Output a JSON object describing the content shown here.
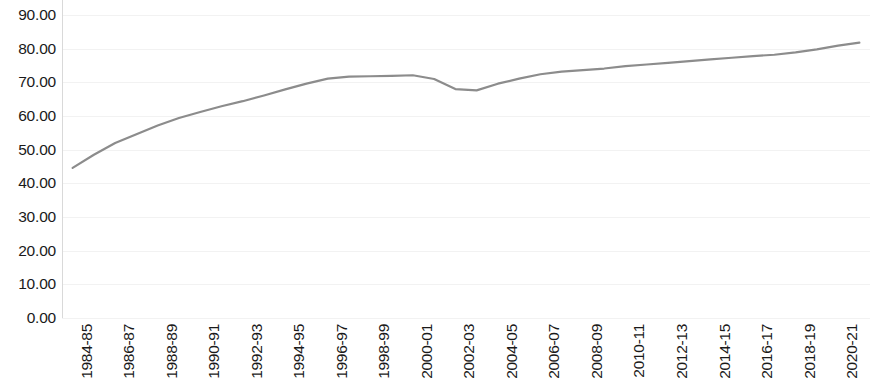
{
  "chart_data": {
    "type": "line",
    "title": "",
    "subtitle": "",
    "xlabel": "",
    "ylabel": "",
    "grid": true,
    "legend": false,
    "legend_position": "none",
    "line_color": "#8c8c8c",
    "line_width": 2.2,
    "ylim": [
      0,
      90
    ],
    "ytick_labels": [
      "90.00",
      "80.00",
      "70.00",
      "60.00",
      "50.00",
      "40.00",
      "30.00",
      "20.00",
      "10.00",
      "0.00"
    ],
    "ytick_values": [
      90,
      80,
      70,
      60,
      50,
      40,
      30,
      20,
      10,
      0
    ],
    "xtick_labels": [
      "1984-85",
      "1986-87",
      "1988-89",
      "1990-91",
      "1992-93",
      "1994-95",
      "1996-97",
      "1998-99",
      "2000-01",
      "2002-03",
      "2004-05",
      "2006-07",
      "2008-09",
      "2010-11",
      "2012-13",
      "2014-15",
      "2016-17",
      "2018-19",
      "2020-21"
    ],
    "categories": [
      "1984-85",
      "1985-86",
      "1986-87",
      "1987-88",
      "1988-89",
      "1989-90",
      "1990-91",
      "1991-92",
      "1992-93",
      "1993-94",
      "1994-95",
      "1995-96",
      "1996-97",
      "1997-98",
      "1998-99",
      "1999-00",
      "2000-01",
      "2001-02",
      "2002-03",
      "2003-04",
      "2004-05",
      "2005-06",
      "2006-07",
      "2007-08",
      "2008-09",
      "2009-10",
      "2010-11",
      "2011-12",
      "2012-13",
      "2013-14",
      "2014-15",
      "2015-16",
      "2016-17",
      "2017-18",
      "2018-19",
      "2019-20",
      "2020-21",
      "2021-22"
    ],
    "values": [
      44.6,
      48.5,
      52.0,
      54.6,
      57.2,
      59.4,
      61.2,
      62.9,
      64.4,
      66.1,
      67.9,
      69.6,
      71.1,
      71.7,
      71.8,
      71.9,
      72.1,
      71.0,
      68.0,
      67.6,
      69.6,
      71.1,
      72.4,
      73.2,
      73.6,
      74.1,
      74.8,
      75.3,
      75.8,
      76.3,
      76.8,
      77.3,
      77.8,
      78.2,
      78.9,
      79.8,
      80.9,
      81.8
    ]
  }
}
